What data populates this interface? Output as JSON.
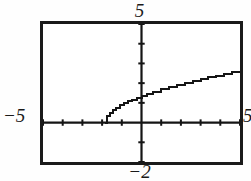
{
  "graph": {
    "title_top_label": "5",
    "bottom_label": "−2",
    "left_label": "−5",
    "right_label": "5"
  },
  "chart_data": {
    "type": "line",
    "title": "",
    "xlabel": "",
    "ylabel": "",
    "xlim": [
      -5,
      5
    ],
    "ylim": [
      -2,
      5
    ],
    "xticks": [
      -5,
      -4,
      -3,
      -2,
      -1,
      0,
      1,
      2,
      3,
      4,
      5
    ],
    "yticks": [
      -2,
      -1,
      0,
      1,
      2,
      3,
      4,
      5
    ],
    "xtick_labels": [
      "-5",
      "",
      "",
      "",
      "",
      "",
      "",
      "",
      "",
      "",
      "5"
    ],
    "ytick_labels": [
      "-2",
      "",
      "",
      "",
      "",
      "",
      "",
      "5"
    ],
    "grid": false,
    "legend": null,
    "axes_style": "crosshair-with-ticks",
    "domain_start": -1.85,
    "series": [
      {
        "name": "y = sqrt(x + 1.85)",
        "x": [
          -1.85,
          -1.75,
          -1.6,
          -1.45,
          -1.3,
          -1.1,
          -0.9,
          -0.7,
          -0.5,
          -0.25,
          0.0,
          0.3,
          0.6,
          1.0,
          1.4,
          1.8,
          2.2,
          2.6,
          3.0,
          3.4,
          3.8,
          4.2,
          4.6,
          5.0
        ],
        "y": [
          0.0,
          0.32,
          0.5,
          0.63,
          0.74,
          0.87,
          0.97,
          1.07,
          1.16,
          1.26,
          1.36,
          1.47,
          1.57,
          1.69,
          1.8,
          1.91,
          2.01,
          2.11,
          2.2,
          2.29,
          2.38,
          2.46,
          2.54,
          2.62
        ]
      }
    ]
  }
}
